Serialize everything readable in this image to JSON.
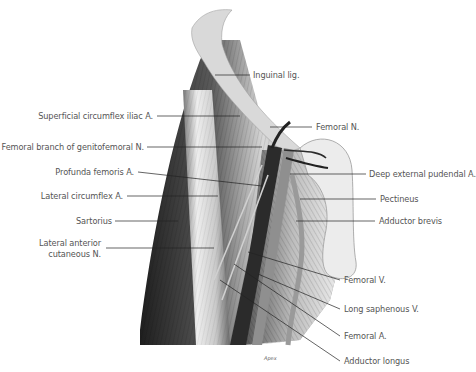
{
  "figure": {
    "type": "anatomical-illustration",
    "signature": "Apex",
    "colors": {
      "background": "#ffffff",
      "label_text": "#555555",
      "leader_line": "#222222",
      "ligament": "#d8d8d8",
      "muscle_dark": "#3a3a3a",
      "muscle_light": "#e6e6e6",
      "vessel_dark": "#2b2b2b",
      "vessel_mid": "#8c8c8c"
    }
  },
  "labels_left": [
    {
      "id": "superficial-circumflex-iliac-a",
      "text": "Superficial circumflex iliac A.",
      "x": 229,
      "y": 116
    },
    {
      "id": "femoral-branch-genitofemoral-n",
      "text": "Femoral branch of genitofemoral N.",
      "x": 143,
      "y": 147
    },
    {
      "id": "profunda-femoris-a",
      "text": "Profunda femoris A.",
      "x": 133,
      "y": 172
    },
    {
      "id": "lateral-circumflex-a",
      "text": "Lateral circumflex A.",
      "x": 122,
      "y": 196
    },
    {
      "id": "sartorius",
      "text": "Sartorius",
      "x": 110,
      "y": 221
    },
    {
      "id": "lateral-anterior-cutaneous-n-1",
      "text": "Lateral anterior",
      "x": 100,
      "y": 242
    },
    {
      "id": "lateral-anterior-cutaneous-n-2",
      "text": "cutaneous N.",
      "x": 100,
      "y": 253
    }
  ],
  "labels_right": [
    {
      "id": "inguinal-lig",
      "text": "Inguinal lig.",
      "x": 253,
      "y": 75
    },
    {
      "id": "femoral-n",
      "text": "Femoral N.",
      "x": 316,
      "y": 127
    },
    {
      "id": "deep-external-pudendal-a",
      "text": "Deep external pudendal A.",
      "x": 370,
      "y": 174
    },
    {
      "id": "pectineus",
      "text": "Pectineus",
      "x": 380,
      "y": 199
    },
    {
      "id": "adductor-brevis",
      "text": "Adductor brevis",
      "x": 379,
      "y": 221
    },
    {
      "id": "femoral-v",
      "text": "Femoral V.",
      "x": 344,
      "y": 280
    },
    {
      "id": "long-saphenous-v",
      "text": "Long saphenous V.",
      "x": 344,
      "y": 309
    },
    {
      "id": "femoral-a",
      "text": "Femoral A.",
      "x": 344,
      "y": 336
    },
    {
      "id": "adductor-longus",
      "text": "Adductor longus",
      "x": 344,
      "y": 361
    }
  ]
}
